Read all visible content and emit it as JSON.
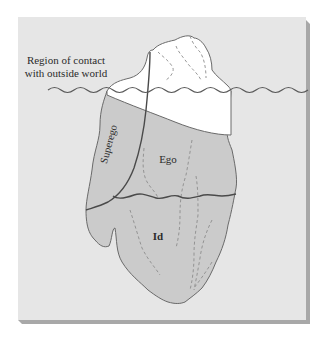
{
  "diagram": {
    "labels": {
      "contact_line1": "Region of contact",
      "contact_line2": "with outside world",
      "superego": "Superego",
      "ego": "Ego",
      "id": "Id"
    },
    "colors": {
      "panel": "#e6e6e6",
      "panel_shadow": "#a8a8a8",
      "iceberg_above": "#ffffff",
      "iceberg_below": "#cbcbcb",
      "outline": "#6a6a6a",
      "strong_line": "#4a4a4a",
      "dashed": "#8c8c8c",
      "text": "#2b2b2b"
    }
  }
}
